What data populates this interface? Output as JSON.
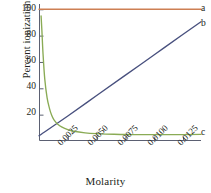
{
  "chart_data": {
    "type": "line",
    "title": "",
    "xlabel": "Molarity",
    "ylabel": "Percent ionization",
    "xlim": [
      0.0,
      0.01405
    ],
    "ylim": [
      0.0,
      104.0
    ],
    "grid": false,
    "legend_position": "right-end-labels",
    "xticks": [
      0.0025,
      0.005,
      0.0075,
      0.01,
      0.0125
    ],
    "xticklabels": [
      "0.0025",
      "0.0050",
      "0.0075",
      "0.0100",
      "0.0125"
    ],
    "yticks": [
      20,
      40,
      60,
      80,
      100
    ],
    "yticklabels": [
      "20",
      "40",
      "60",
      "80",
      "100"
    ],
    "series": [
      {
        "name": "a",
        "label": "a",
        "color": "#cd7f53",
        "description": "strong acid, complete ionization, constant at 100 percent",
        "x": [
          0.0,
          0.0025,
          0.005,
          0.0075,
          0.01,
          0.0125,
          0.01405
        ],
        "values": [
          100,
          100,
          100,
          100,
          100,
          100,
          100
        ]
      },
      {
        "name": "b",
        "label": "b",
        "color": "#48507e",
        "description": "linear increase with molarity",
        "x": [
          0.0,
          0.0025,
          0.005,
          0.0075,
          0.01,
          0.0125,
          0.01405
        ],
        "values": [
          4.0,
          19.0,
          34.5,
          50.0,
          65.5,
          81.0,
          90.5
        ]
      },
      {
        "name": "c",
        "label": "c",
        "color": "#8aab55",
        "description": "weak acid, percent ionization falls steeply then levels off",
        "x": [
          0.00018,
          0.00025,
          0.00035,
          0.0005,
          0.0007,
          0.0009,
          0.0011,
          0.0013,
          0.0016,
          0.002,
          0.0025,
          0.003,
          0.004,
          0.005,
          0.0065,
          0.008,
          0.01,
          0.0125,
          0.01405
        ],
        "values": [
          95.0,
          84.0,
          66.0,
          47.0,
          33.0,
          25.0,
          19.5,
          16.0,
          13.0,
          10.5,
          8.6,
          7.4,
          6.2,
          5.6,
          5.1,
          4.9,
          4.8,
          4.9,
          5.0
        ]
      }
    ]
  },
  "axis": {
    "frame_color": "#5b6072",
    "tick_color": "#5b6072"
  }
}
